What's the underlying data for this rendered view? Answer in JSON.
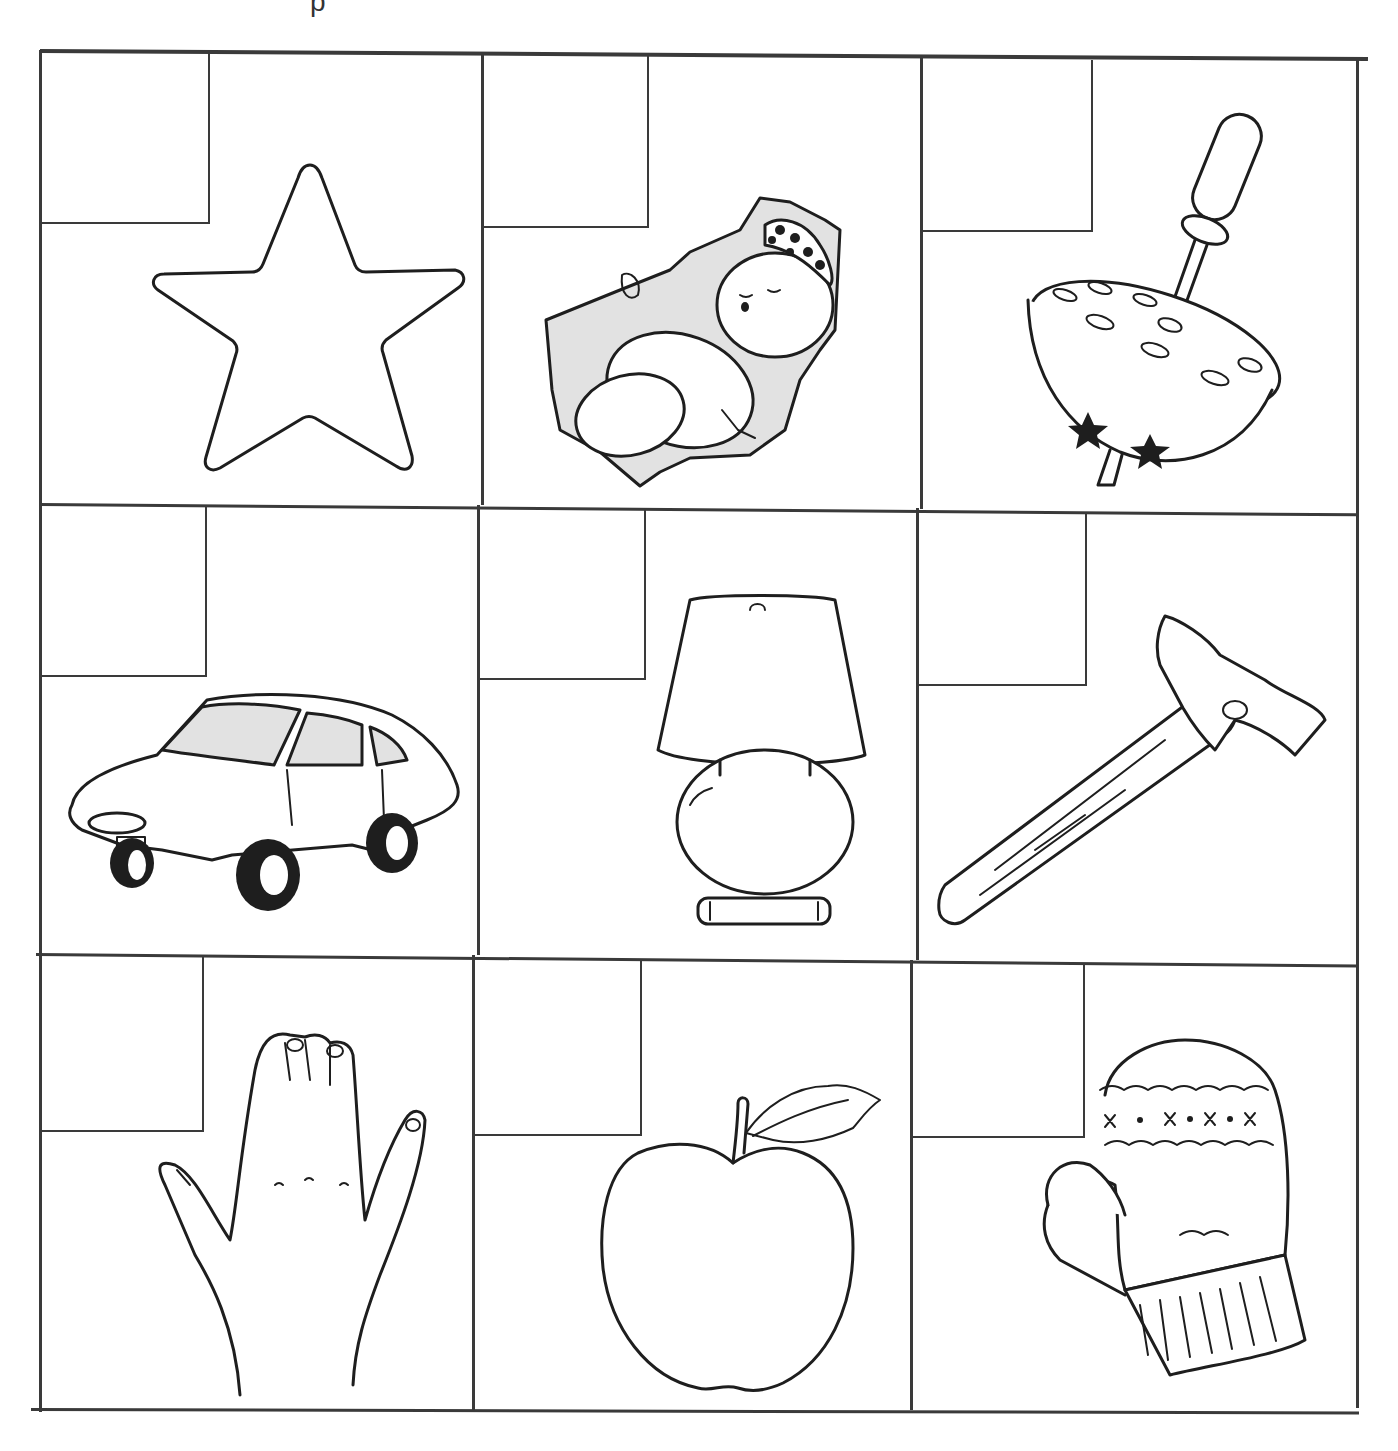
{
  "page": {
    "top_fragment": "p",
    "grid": {
      "rows": 3,
      "cols": 3,
      "line_color": "#3a3a3a"
    },
    "cells": [
      {
        "row": 1,
        "col": 1,
        "picture": "star",
        "answer_box": ""
      },
      {
        "row": 1,
        "col": 2,
        "picture": "baby",
        "answer_box": ""
      },
      {
        "row": 1,
        "col": 3,
        "picture": "spinning top",
        "answer_box": ""
      },
      {
        "row": 2,
        "col": 1,
        "picture": "car",
        "answer_box": ""
      },
      {
        "row": 2,
        "col": 2,
        "picture": "lamp",
        "answer_box": ""
      },
      {
        "row": 2,
        "col": 3,
        "picture": "hammer",
        "answer_box": ""
      },
      {
        "row": 3,
        "col": 1,
        "picture": "hand",
        "answer_box": ""
      },
      {
        "row": 3,
        "col": 2,
        "picture": "apple",
        "answer_box": ""
      },
      {
        "row": 3,
        "col": 3,
        "picture": "mitten",
        "answer_box": ""
      }
    ]
  }
}
